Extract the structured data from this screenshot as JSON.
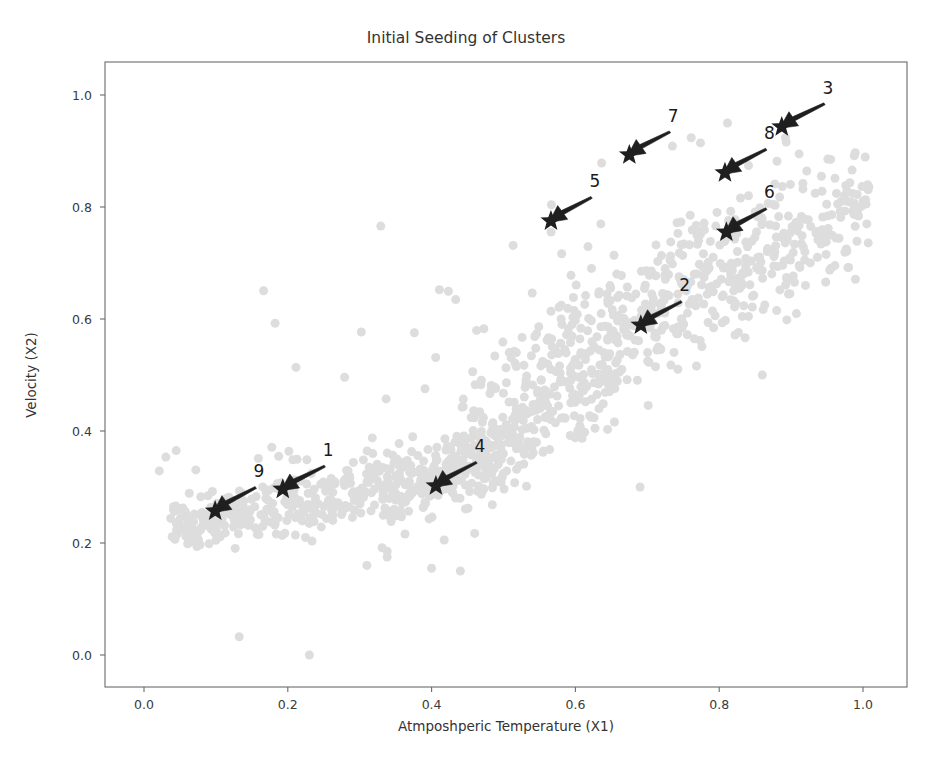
{
  "chart_data": {
    "type": "scatter",
    "title": "Initial Seeding of Clusters",
    "xlabel": "Atmposhperic Temperature (X1)",
    "ylabel": "Velocity (X2)",
    "xlim": [
      -0.055,
      1.06
    ],
    "ylim": [
      -0.06,
      1.06
    ],
    "xticks": [
      0.0,
      0.2,
      0.4,
      0.6,
      0.8,
      1.0
    ],
    "yticks": [
      0.0,
      0.2,
      0.4,
      0.6,
      0.8,
      1.0
    ],
    "xtick_labels": [
      "0.0",
      "0.2",
      "0.4",
      "0.6",
      "0.8",
      "1.0"
    ],
    "ytick_labels": [
      "0.0",
      "0.2",
      "0.4",
      "0.6",
      "0.8",
      "1.0"
    ],
    "grid": false,
    "legend": "none",
    "background_series": {
      "name": "data points",
      "color": "#dddddd",
      "marker": "circle",
      "marker_size": 9,
      "n_points": 1100,
      "description": "Light gray point cloud forming two elongated diagonal bands: a lower band from (0.05,0.22) to (0.48,0.36) and an upper band from (0.45,0.45) to (1.0,1.0), connected by a sparse diagonal bridge."
    },
    "seed_series": {
      "name": "initial cluster seeds",
      "color": "#1f1f1f",
      "marker": "star",
      "points": [
        {
          "label": "1",
          "x": 0.193,
          "y": 0.296,
          "label_x": 0.256,
          "label_y": 0.352
        },
        {
          "label": "2",
          "x": 0.691,
          "y": 0.589,
          "label_x": 0.752,
          "label_y": 0.646
        },
        {
          "label": "3",
          "x": 0.887,
          "y": 0.943,
          "label_x": 0.951,
          "label_y": 0.999
        },
        {
          "label": "4",
          "x": 0.406,
          "y": 0.302,
          "label_x": 0.467,
          "label_y": 0.359
        },
        {
          "label": "5",
          "x": 0.566,
          "y": 0.775,
          "label_x": 0.627,
          "label_y": 0.832
        },
        {
          "label": "6",
          "x": 0.81,
          "y": 0.755,
          "label_x": 0.87,
          "label_y": 0.812
        },
        {
          "label": "7",
          "x": 0.675,
          "y": 0.893,
          "label_x": 0.736,
          "label_y": 0.949
        },
        {
          "label": "8",
          "x": 0.808,
          "y": 0.861,
          "label_x": 0.87,
          "label_y": 0.918
        },
        {
          "label": "9",
          "x": 0.099,
          "y": 0.257,
          "label_x": 0.16,
          "label_y": 0.314
        }
      ]
    },
    "seed_count": 9
  }
}
